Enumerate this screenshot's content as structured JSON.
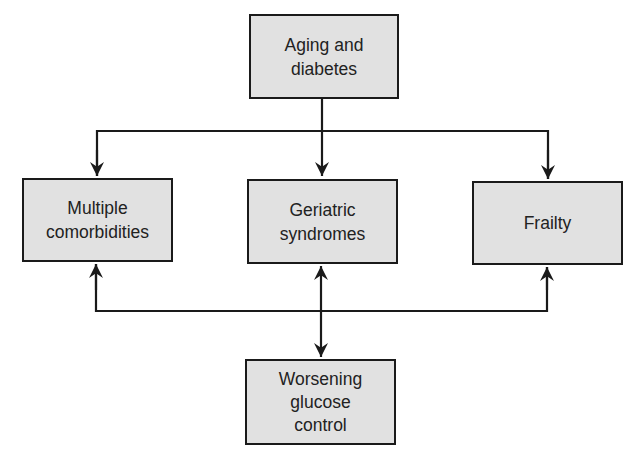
{
  "diagram": {
    "colors": {
      "box_fill": "#e1e1e1",
      "box_border": "#1a1a1a",
      "line": "#1a1a1a",
      "text": "#222222"
    },
    "nodes": {
      "top": {
        "label": "Aging and\ndiabetes"
      },
      "left": {
        "label": "Multiple\ncomorbidities"
      },
      "middle": {
        "label": "Geriatric\nsyndromes"
      },
      "right": {
        "label": "Frailty"
      },
      "bottom": {
        "label": "Worsening\nglucose\ncontrol"
      }
    },
    "edges": [
      {
        "from": "top",
        "to": "left",
        "direction": "forward"
      },
      {
        "from": "top",
        "to": "middle",
        "direction": "forward"
      },
      {
        "from": "top",
        "to": "right",
        "direction": "forward"
      },
      {
        "from": "bottom",
        "to": "left",
        "direction": "forward"
      },
      {
        "from": "bottom",
        "to": "right",
        "direction": "forward"
      },
      {
        "from": "middle",
        "to": "bottom",
        "direction": "bidirectional"
      }
    ]
  }
}
